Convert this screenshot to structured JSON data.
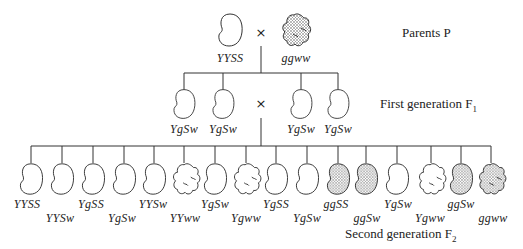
{
  "labels": {
    "parents": "Parents P",
    "f1": "First generation F",
    "f1_sub": "1",
    "f2": "Second generation F",
    "f2_sub": "2",
    "cross_symbol": "×"
  },
  "parents": [
    {
      "genotype": "YYSS",
      "phenotype": "yellow-smooth"
    },
    {
      "genotype": "ggww",
      "phenotype": "green-wrinkled"
    }
  ],
  "f1": [
    {
      "genotype": "YgSw",
      "phenotype": "yellow-smooth"
    },
    {
      "genotype": "YgSw",
      "phenotype": "yellow-smooth"
    },
    {
      "genotype": "YgSw",
      "phenotype": "yellow-smooth"
    },
    {
      "genotype": "YgSw",
      "phenotype": "yellow-smooth"
    }
  ],
  "f2": [
    {
      "genotype": "YYSS",
      "phenotype": "yellow-smooth"
    },
    {
      "genotype": "YYSw",
      "phenotype": "yellow-smooth"
    },
    {
      "genotype": "YgSS",
      "phenotype": "yellow-smooth"
    },
    {
      "genotype": "YgSw",
      "phenotype": "yellow-smooth"
    },
    {
      "genotype": "YYSw",
      "phenotype": "yellow-smooth"
    },
    {
      "genotype": "YYww",
      "phenotype": "yellow-wrinkled"
    },
    {
      "genotype": "YgSw",
      "phenotype": "yellow-smooth"
    },
    {
      "genotype": "Ygww",
      "phenotype": "yellow-wrinkled"
    },
    {
      "genotype": "YgSS",
      "phenotype": "yellow-smooth"
    },
    {
      "genotype": "YgSw",
      "phenotype": "yellow-smooth"
    },
    {
      "genotype": "ggSS",
      "phenotype": "green-smooth"
    },
    {
      "genotype": "ggSw",
      "phenotype": "green-smooth"
    },
    {
      "genotype": "YgSw",
      "phenotype": "yellow-smooth"
    },
    {
      "genotype": "Ygww",
      "phenotype": "yellow-wrinkled"
    },
    {
      "genotype": "ggSw",
      "phenotype": "green-smooth"
    },
    {
      "genotype": "ggww",
      "phenotype": "green-wrinkled"
    }
  ]
}
